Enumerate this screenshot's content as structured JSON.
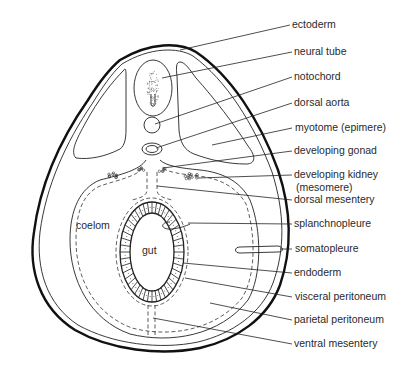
{
  "diagram": {
    "colors": {
      "line": "#111111",
      "text": "#2a2a2a",
      "background": "#ffffff"
    },
    "inner_labels": [
      {
        "id": "coelom",
        "text": "coelom"
      },
      {
        "id": "gut",
        "text": "gut"
      }
    ],
    "labels": [
      {
        "id": "ectoderm",
        "text": "ectoderm"
      },
      {
        "id": "neural-tube",
        "text": "neural tube"
      },
      {
        "id": "notochord",
        "text": "notochord"
      },
      {
        "id": "dorsal-aorta",
        "text": "dorsal aorta"
      },
      {
        "id": "myotome",
        "text": "myotome (epimere)"
      },
      {
        "id": "developing-gonad",
        "text": "developing gonad"
      },
      {
        "id": "developing-kidney",
        "text": "developing kidney",
        "text2": "(mesomere)"
      },
      {
        "id": "dorsal-mesentery",
        "text": "dorsal mesentery"
      },
      {
        "id": "splanchnopleure",
        "text": "splanchnopleure"
      },
      {
        "id": "somatopleure",
        "text": "somatopleure"
      },
      {
        "id": "endoderm",
        "text": "endoderm"
      },
      {
        "id": "visceral-peritoneum",
        "text": "visceral peritoneum"
      },
      {
        "id": "parietal-peritoneum",
        "text": "parietal peritoneum"
      },
      {
        "id": "ventral-mesentery",
        "text": "ventral mesentery"
      }
    ]
  }
}
